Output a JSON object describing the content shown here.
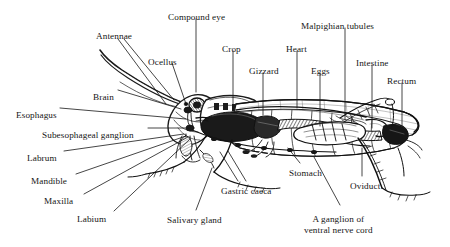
{
  "figure": {
    "background_color": "#ffffff",
    "ink_color": "#161616",
    "width": 450,
    "height": 247
  },
  "labels": [
    {
      "id": "antennae",
      "text": "Antennae",
      "x": 96,
      "y": 31,
      "anchor": "start"
    },
    {
      "id": "compound-eye",
      "text": "Compound eye",
      "x": 168,
      "y": 12,
      "anchor": "start"
    },
    {
      "id": "ocellus",
      "text": "Ocellus",
      "x": 148,
      "y": 57,
      "anchor": "start"
    },
    {
      "id": "crop",
      "text": "Crop",
      "x": 222,
      "y": 44,
      "anchor": "start"
    },
    {
      "id": "gizzard",
      "text": "Gizzard",
      "x": 249,
      "y": 66,
      "anchor": "start"
    },
    {
      "id": "heart",
      "text": "Heart",
      "x": 286,
      "y": 44,
      "anchor": "start"
    },
    {
      "id": "eggs",
      "text": "Eggs",
      "x": 311,
      "y": 66,
      "anchor": "start"
    },
    {
      "id": "malpighian",
      "text": "Malpighian tubules",
      "x": 301,
      "y": 21,
      "anchor": "start"
    },
    {
      "id": "intestine",
      "text": "Intestine",
      "x": 356,
      "y": 58,
      "anchor": "start"
    },
    {
      "id": "rectum",
      "text": "Rectum",
      "x": 387,
      "y": 76,
      "anchor": "start"
    },
    {
      "id": "brain",
      "text": "Brain",
      "x": 93,
      "y": 92,
      "anchor": "start"
    },
    {
      "id": "esophagus",
      "text": "Esophagus",
      "x": 16,
      "y": 110,
      "anchor": "start"
    },
    {
      "id": "subesophageal",
      "text": "Subesophageal ganglion",
      "x": 42,
      "y": 130,
      "anchor": "start"
    },
    {
      "id": "labrum",
      "text": "Labrum",
      "x": 27,
      "y": 153,
      "anchor": "start"
    },
    {
      "id": "mandible",
      "text": "Mandible",
      "x": 31,
      "y": 176,
      "anchor": "start"
    },
    {
      "id": "maxilla",
      "text": "Maxilla",
      "x": 44,
      "y": 196,
      "anchor": "start"
    },
    {
      "id": "labium",
      "text": "Labium",
      "x": 77,
      "y": 214,
      "anchor": "start"
    },
    {
      "id": "salivary-gland",
      "text": "Salivary gland",
      "x": 167,
      "y": 215,
      "anchor": "start"
    },
    {
      "id": "gastric-caeca",
      "text": "Gastric caeca",
      "x": 221,
      "y": 186,
      "anchor": "start"
    },
    {
      "id": "stomach",
      "text": "Stomach",
      "x": 289,
      "y": 168,
      "anchor": "start"
    },
    {
      "id": "oviduct",
      "text": "Oviduct",
      "x": 350,
      "y": 181,
      "anchor": "start"
    }
  ],
  "multiline_labels": [
    {
      "id": "ventral-nerve-cord-ganglion",
      "lines": [
        "A ganglion of",
        "ventral nerve cord"
      ],
      "x": 304,
      "y": 214
    }
  ],
  "leader_lines": [
    {
      "id": "antennae-a",
      "x1": 118,
      "y1": 39,
      "x2": 166,
      "y2": 104
    },
    {
      "id": "antennae-b",
      "x1": 124,
      "y1": 39,
      "x2": 174,
      "y2": 100
    },
    {
      "id": "compound-eye",
      "x1": 196,
      "y1": 19,
      "x2": 196,
      "y2": 92
    },
    {
      "id": "ocellus",
      "x1": 172,
      "y1": 63,
      "x2": 186,
      "y2": 104
    },
    {
      "id": "crop",
      "x1": 233,
      "y1": 51,
      "x2": 233,
      "y2": 110
    },
    {
      "id": "gizzard",
      "x1": 263,
      "y1": 73,
      "x2": 263,
      "y2": 115
    },
    {
      "id": "heart",
      "x1": 297,
      "y1": 51,
      "x2": 297,
      "y2": 108
    },
    {
      "id": "eggs",
      "x1": 320,
      "y1": 73,
      "x2": 320,
      "y2": 126
    },
    {
      "id": "malpighian",
      "x1": 345,
      "y1": 28,
      "x2": 345,
      "y2": 120
    },
    {
      "id": "intestine",
      "x1": 372,
      "y1": 65,
      "x2": 372,
      "y2": 128
    },
    {
      "id": "rectum",
      "x1": 402,
      "y1": 83,
      "x2": 402,
      "y2": 126
    },
    {
      "id": "brain",
      "x1": 118,
      "y1": 90,
      "x2": 181,
      "y2": 109
    },
    {
      "id": "esophagus",
      "x1": 60,
      "y1": 108,
      "x2": 186,
      "y2": 119
    },
    {
      "id": "subesophageal",
      "x1": 148,
      "y1": 128,
      "x2": 188,
      "y2": 128
    },
    {
      "id": "labrum",
      "x1": 64,
      "y1": 151,
      "x2": 184,
      "y2": 134
    },
    {
      "id": "mandible",
      "x1": 76,
      "y1": 174,
      "x2": 186,
      "y2": 136
    },
    {
      "id": "maxilla",
      "x1": 84,
      "y1": 194,
      "x2": 188,
      "y2": 137
    },
    {
      "id": "labium",
      "x1": 114,
      "y1": 211,
      "x2": 190,
      "y2": 139
    },
    {
      "id": "salivary-gland",
      "x1": 196,
      "y1": 210,
      "x2": 212,
      "y2": 168
    },
    {
      "id": "gastric-caeca-a",
      "x1": 238,
      "y1": 181,
      "x2": 220,
      "y2": 152
    },
    {
      "id": "gastric-caeca-b",
      "x1": 246,
      "y1": 181,
      "x2": 228,
      "y2": 151
    },
    {
      "id": "stomach",
      "x1": 300,
      "y1": 163,
      "x2": 288,
      "y2": 148
    },
    {
      "id": "ventral-ganglion",
      "x1": 340,
      "y1": 205,
      "x2": 314,
      "y2": 157
    },
    {
      "id": "oviduct",
      "x1": 362,
      "y1": 176,
      "x2": 362,
      "y2": 148
    }
  ]
}
